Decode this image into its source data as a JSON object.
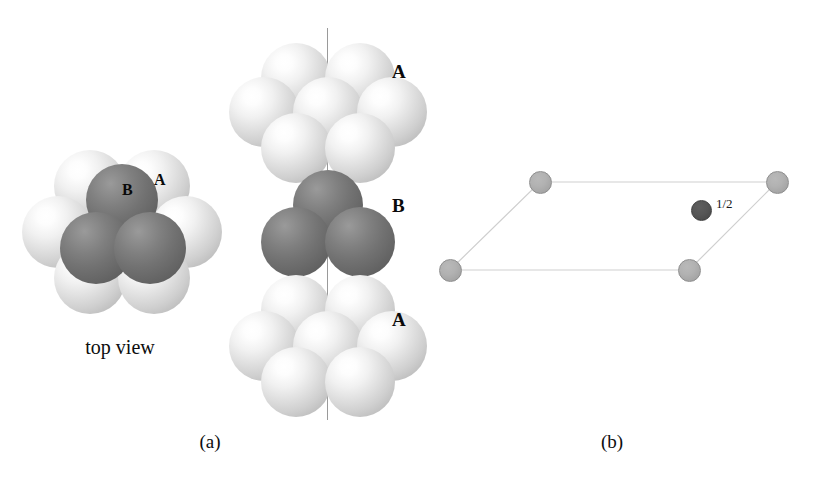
{
  "figure": {
    "kind": "hexagonal-close-packed-structure-diagram",
    "background_color": "#ffffff",
    "captions": [
      {
        "id": "a",
        "text": "(a)",
        "x": 210,
        "y": 432
      },
      {
        "id": "b",
        "text": "(b)",
        "x": 612,
        "y": 432
      }
    ]
  },
  "panel_a": {
    "top_view": {
      "caption": "top view",
      "caption_x": 120,
      "caption_y": 337,
      "center_x": 122,
      "center_y": 232,
      "sphere_diameter": 72,
      "labels": [
        {
          "text": "A",
          "x": 154,
          "y": 172,
          "size": "small"
        },
        {
          "text": "B",
          "x": 122,
          "y": 182,
          "size": "small"
        }
      ],
      "layer_A_spheres": [
        {
          "cx": 90,
          "cy": 186,
          "shade": "light"
        },
        {
          "cx": 154,
          "cy": 186,
          "shade": "light"
        },
        {
          "cx": 58,
          "cy": 232,
          "shade": "light"
        },
        {
          "cx": 186,
          "cy": 232,
          "shade": "light"
        },
        {
          "cx": 90,
          "cy": 278,
          "shade": "light"
        },
        {
          "cx": 154,
          "cy": 278,
          "shade": "light"
        }
      ],
      "layer_B_spheres": [
        {
          "cx": 122,
          "cy": 200,
          "shade": "dark"
        },
        {
          "cx": 96,
          "cy": 248,
          "shade": "dark"
        },
        {
          "cx": 150,
          "cy": 248,
          "shade": "dark"
        }
      ]
    },
    "side_view": {
      "axis_line": {
        "x": 327,
        "y_top": 28,
        "y_bottom": 420,
        "color": "#9a9a9a"
      },
      "layers": [
        {
          "label": "A",
          "label_x": 392,
          "label_y": 62,
          "shade": "light",
          "sphere_diameter": 70,
          "spheres": [
            {
              "cx": 296,
              "cy": 78
            },
            {
              "cx": 360,
              "cy": 78
            },
            {
              "cx": 264,
              "cy": 112
            },
            {
              "cx": 328,
              "cy": 112
            },
            {
              "cx": 392,
              "cy": 112
            },
            {
              "cx": 296,
              "cy": 148
            },
            {
              "cx": 360,
              "cy": 148
            }
          ]
        },
        {
          "label": "B",
          "label_x": 392,
          "label_y": 196,
          "shade": "dark",
          "sphere_diameter": 70,
          "spheres": [
            {
              "cx": 328,
              "cy": 205
            },
            {
              "cx": 296,
              "cy": 242
            },
            {
              "cx": 360,
              "cy": 242
            }
          ]
        },
        {
          "label": "A",
          "label_x": 392,
          "label_y": 310,
          "shade": "light",
          "sphere_diameter": 70,
          "spheres": [
            {
              "cx": 296,
              "cy": 310
            },
            {
              "cx": 360,
              "cy": 310
            },
            {
              "cx": 264,
              "cy": 346
            },
            {
              "cx": 328,
              "cy": 346
            },
            {
              "cx": 392,
              "cy": 346
            },
            {
              "cx": 296,
              "cy": 382
            },
            {
              "cx": 360,
              "cy": 382
            }
          ]
        }
      ]
    }
  },
  "panel_b": {
    "cell_type": "rhombic-unit-cell-projection",
    "edge_color": "#cfcfcf",
    "vertices": [
      {
        "name": "bottom-left",
        "x": 450,
        "y": 270
      },
      {
        "name": "top-left",
        "x": 540,
        "y": 182
      },
      {
        "name": "top-right",
        "x": 777,
        "y": 182
      },
      {
        "name": "bottom-right",
        "x": 689,
        "y": 270
      }
    ],
    "corner_node_diameter": 23,
    "interior_node": {
      "label": "1/2",
      "x": 701,
      "y": 210,
      "diameter": 21,
      "label_x": 716,
      "label_y": 197
    }
  }
}
